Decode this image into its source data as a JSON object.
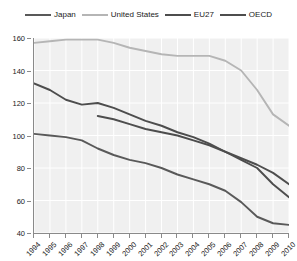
{
  "chart_data": {
    "type": "line",
    "title": "",
    "xlabel": "",
    "ylabel": "",
    "xlim": [
      1994,
      2010
    ],
    "ylim": [
      40,
      160
    ],
    "yticks": [
      40,
      60,
      80,
      100,
      120,
      140,
      160
    ],
    "grid": true,
    "legend_position": "top",
    "x": [
      1994,
      1995,
      1996,
      1997,
      1998,
      1999,
      2000,
      2001,
      2002,
      2003,
      2004,
      2005,
      2006,
      2007,
      2008,
      2009,
      2010
    ],
    "series": [
      {
        "name": "Japan",
        "color": "#595959",
        "values": [
          101,
          100,
          99,
          97,
          92,
          88,
          85,
          83,
          80,
          76,
          73,
          70,
          66,
          59,
          50,
          46,
          45
        ]
      },
      {
        "name": "United States",
        "color": "#b5b5b5",
        "values": [
          157,
          158,
          159,
          159,
          159,
          157,
          154,
          152,
          150,
          149,
          149,
          149,
          146,
          140,
          128,
          113,
          106
        ]
      },
      {
        "name": "EU27",
        "color": "#4d4d4d",
        "values": [
          132,
          128,
          122,
          119,
          120,
          117,
          113,
          109,
          106,
          102,
          99,
          95,
          90,
          85,
          80,
          70,
          62
        ]
      },
      {
        "name": "OECD",
        "color": "#4d4d4d",
        "values": [
          null,
          null,
          null,
          null,
          112,
          110,
          107,
          104,
          102,
          100,
          97,
          94,
          90,
          86,
          82,
          77,
          70
        ]
      }
    ]
  },
  "legend": {
    "entries": [
      {
        "label": "Japan"
      },
      {
        "label": "United States"
      },
      {
        "label": "EU27"
      },
      {
        "label": "OECD"
      }
    ]
  },
  "axes": {
    "y_tick_labels": [
      "160",
      "140",
      "120",
      "100",
      "80",
      "60",
      "40"
    ],
    "x_tick_labels": [
      "1994",
      "1995",
      "1996",
      "1997",
      "1998",
      "1999",
      "2000",
      "2001",
      "2002",
      "2003",
      "2004",
      "2005",
      "2006",
      "2007",
      "2008",
      "2009",
      "2010"
    ]
  },
  "colors": {
    "plot_background": "#f0f0f0",
    "gridline": "#ffffff",
    "axis": "#8a8a8a",
    "text": "#1a1a1a"
  }
}
